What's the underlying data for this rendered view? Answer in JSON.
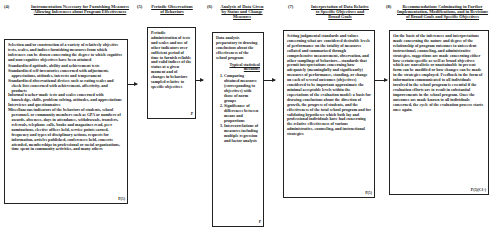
{
  "diagram": {
    "steps": [
      {
        "number": "(4)",
        "title": "Instrumentation Necessary for Furnishing Measures Allowing Inferences about Program Effectiveness",
        "intro": "Selection and/or construction of a variety of relatively objective tests, scales, and indices furnishing measures from which inferences can be drawn concerning the degree to which cognitive and non-cognitive objectives have been attained",
        "items": [
          "Standardized aptitude, ability and achievement tests",
          "Standardized self-inventories concerned with adjustment, appreciations, attitudes, interests and temperament",
          "Standardized observational devices such as rating scales and check lists concerned with achievement, affectivity, and products",
          "Informal teacher-made tests and scales concerned with knowledge, skills, problem solving, attitudes, and appreciations",
          "Interviews and questionnaires",
          "Miscellaneous indicators of the behaviors of students, school personnel, or community members such as GPA or numbers of awards, absences, days in attendance, withdrawals, transfers, referrals, telephone calls, books and magazines read, peer nominations, elective offices held, service points earned, frequency and types of disciplinary actions, requests for information, articles published, conferences held, concerts attended, memberships in professional or social organizations, time spent in community activities, and many others"
        ],
        "code": "P(5)"
      },
      {
        "number": "(5)",
        "title": "Periodic Observations of Behaviors",
        "text": "Periodic administration of tests and scales and use of other indicators over sufficient period of time to furnish reliable and valid indices of the status at a given moment and of changes in behaviors sampled relative to specific objectives",
        "code": "P"
      },
      {
        "number": "(6)",
        "title": "Analysis of Data Given by Status and Change Measures",
        "text": "Data analysis preparatory to drawing conclusions about the effectiveness of the school program",
        "subheading": "Typical statistical methods:",
        "methods": [
          "Comparing obtained measures (corresponding to objectives) with those of norm groups",
          "Significance of differences between means and proportions",
          "Intercorrelations of measures including multiple regression and factor analysis"
        ],
        "code": "P"
      },
      {
        "number": "(7)",
        "title": "Interpretation of Data Relative to Specific Objectives and Broad Goals",
        "text": "Setting judgmental standards and values concerning what are considered desirable levels of performance on the totality of measures collated and summarized through comprehensive measurement, observation, and other samplings of behaviors—standards that permit interpretations concerning how adequately (meaningfully and significantly) measures of performance, standing, or change on each of several outcomes (objectives) considered to be important approximate the minimal acceptable levels within the expectations of the evaluation model: a basis for drawing conclusions about the direction of growth, the progress of students, and the effectiveness of the total school program and for validating hypotheses which both lay and professional individuals have had concerning the relative effectiveness of various administrative, counseling, and instructional strategies",
        "code": "P(5)"
      },
      {
        "number": "(8)",
        "title": "Recommendations Culminating in Further Implementation, Modifications, and in Revisions of Broad Goals and Specific Objectives",
        "text": "On the basis of the inferences and interpretations made concerning the nature and degree of the relationship of program outcomes to antecedent instructional, counseling, and administrative strategies, suggestions are made concerning either how certain specific as well as broad objectives which are unrealistic or unattainable in present form can be modified or how changes can be made in the strategies employed. Feedback in the form of information communicated to all individuals involved in the school program is essential if the evaluation efforts are to result in substantial improvements in the school program. Once the outcomes are made known to all individuals concerned, the cycle of the evaluation process starts once again.",
        "code": "P(5)(C1-)"
      }
    ],
    "outer_code": "P(5)"
  }
}
